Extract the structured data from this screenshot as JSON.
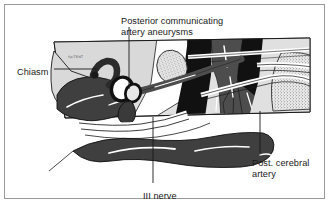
{
  "figure": {
    "kind": "anatomical-line-drawing",
    "micro_text": "TA/TENT"
  },
  "labels": {
    "title": "Posterior communicating\nartery aneurysms",
    "chiasm": "Chiasm",
    "posterior_cerebral_artery": "Post. cerebral\nartery",
    "third_nerve": "III nerve"
  },
  "colors": {
    "ink": "#1a1a1a",
    "frame": "#9a9a9a",
    "page": "#ffffff",
    "light_gray": "#d9d9d9",
    "mid_gray": "#b3b3b3",
    "dark_gray": "#4d4d4d",
    "black": "#111111",
    "highlight": "#ffffff"
  }
}
